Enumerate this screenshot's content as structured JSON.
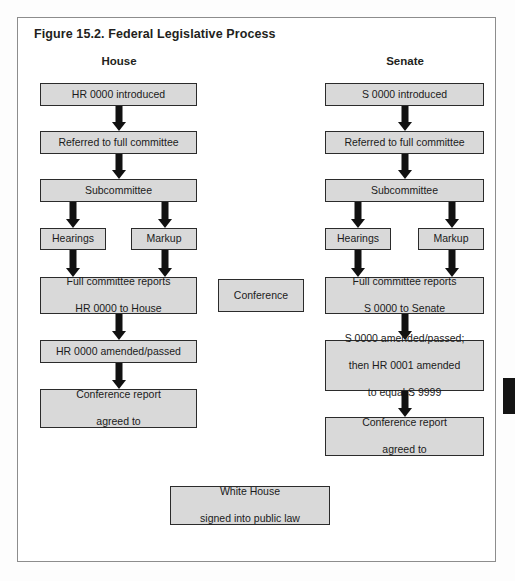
{
  "figure": {
    "title": "Figure 15.2. Federal Legislative Process",
    "frame_border_color": "#8d8d8d",
    "node_fill_color": "#d9d9d9",
    "node_border_color": "#2b2b2b",
    "arrow_color": "#111111"
  },
  "columns": {
    "house": {
      "heading": "House"
    },
    "senate": {
      "heading": "Senate"
    }
  },
  "house_nodes": {
    "introduced": "HR 0000 introduced",
    "referred": "Referred to full committee",
    "subcommittee": "Subcommittee",
    "hearings": "Hearings",
    "markup": "Markup",
    "full_committee_reports_line1": "Full committee reports",
    "full_committee_reports_line2": "HR 0000 to House",
    "amended_passed": "HR 0000 amended/passed",
    "conference_report_line1": "Conference report",
    "conference_report_line2": "agreed to"
  },
  "senate_nodes": {
    "introduced": "S 0000 introduced",
    "referred": "Referred to full committee",
    "subcommittee": "Subcommittee",
    "hearings": "Hearings",
    "markup": "Markup",
    "full_committee_reports_line1": "Full committee reports",
    "full_committee_reports_line2": "S 0000 to Senate",
    "amended_passed_line1": "S 0000 amended/passed;",
    "amended_passed_line2": "then HR 0001 amended",
    "amended_passed_line3": "to equal S 9999",
    "conference_report_line1": "Conference report",
    "conference_report_line2": "agreed to"
  },
  "center_nodes": {
    "conference": "Conference",
    "white_house_line1": "White House",
    "white_house_line2": "signed into public law"
  }
}
